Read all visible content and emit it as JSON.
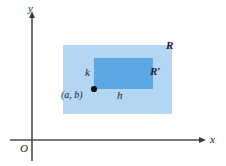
{
  "figure": {
    "title": "",
    "axes": {
      "y_label": "y",
      "x_label": "x",
      "origin_label": "O"
    },
    "labels": {
      "outer_region": "R",
      "inner_region": "R′",
      "width_label": "h",
      "height_label": "k",
      "point_label": "(a, b)"
    },
    "colors": {
      "outer_fill": "#b3d6f2",
      "inner_fill": "#5ca8e2",
      "axis": "#4d4d4d",
      "point": "#111111",
      "text": "#1b1b1b",
      "background": "#ffffff"
    },
    "geometry": {
      "outer_rect": {
        "x": 63,
        "y": 45,
        "width": 109,
        "height": 69
      },
      "inner_rect": {
        "x": 94,
        "y": 58,
        "width": 59,
        "height": 31
      },
      "point": {
        "x": 94,
        "y": 89
      },
      "y_axis_x": 32,
      "x_axis_y": 140
    }
  }
}
